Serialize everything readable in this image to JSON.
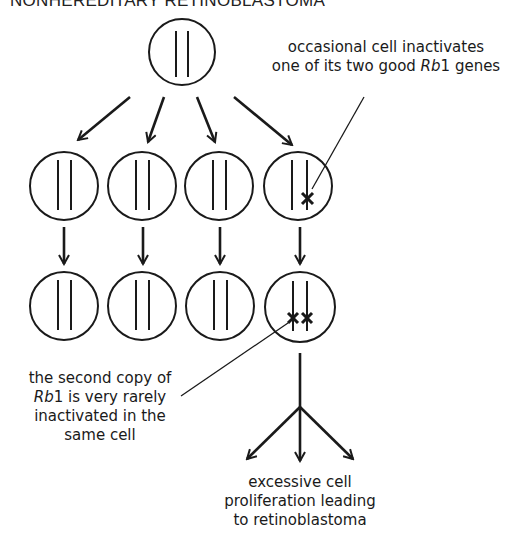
{
  "title": "NONHEREDITARY RETINOBLASTOMA",
  "annotations": {
    "top_right": {
      "line1": "occasional cell inactivates",
      "line2_prefix": "one of its two good ",
      "line2_gene": "Rb",
      "line2_gene_num": "1",
      "line2_suffix": " genes"
    },
    "bottom_left": {
      "line1": "the second copy of",
      "line2_gene": "Rb",
      "line2_gene_num": "1",
      "line2_suffix": " is very rarely",
      "line3": "inactivated in the",
      "line4": "same cell"
    },
    "outcome": {
      "line1": "excessive cell",
      "line2": "proliferation leading",
      "line3": "to retinoblastoma"
    }
  },
  "cells": {
    "parent": {
      "mutations": 0
    },
    "generation1": [
      {
        "mutations": 0
      },
      {
        "mutations": 0
      },
      {
        "mutations": 0
      },
      {
        "mutations": 1
      }
    ],
    "generation2": [
      {
        "mutations": 0
      },
      {
        "mutations": 0
      },
      {
        "mutations": 0
      },
      {
        "mutations": 2
      }
    ]
  },
  "colors": {
    "stroke": "#1a1a1a",
    "background": "#ffffff"
  }
}
